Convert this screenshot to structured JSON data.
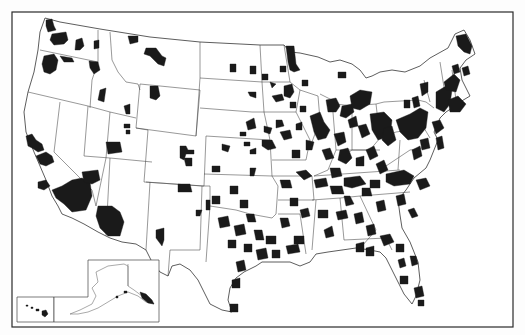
{
  "map": {
    "title": "",
    "subject": "United States counties (shaded areas)",
    "colors": {
      "background": "#ffffff",
      "frame": "#2a2a2a",
      "boundary": "#444444",
      "shaded": "#1a1a1a"
    },
    "frame": {
      "x": 12,
      "y": 12,
      "width": 501,
      "height": 315
    },
    "inset": {
      "label": "Alaska and Hawaii inset",
      "box": {
        "x": 17,
        "y": 260,
        "width": 142,
        "height": 62
      },
      "hawaii_scale_label": "",
      "alaska_scale_label": ""
    },
    "legend": []
  }
}
